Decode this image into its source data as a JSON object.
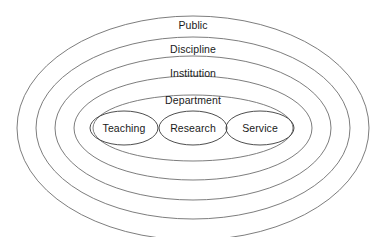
{
  "diagram": {
    "type": "nested-ellipse-venn",
    "title": "",
    "background_color": "#ffffff",
    "ring_stroke_color": "#6e6e6e",
    "core_stroke_color": "#3a3a3a",
    "text_color": "#1a1a1a",
    "center": {
      "cx": 193,
      "cy": 128
    },
    "rings": [
      {
        "label": "Public",
        "level": 1,
        "rx": 176,
        "ry": 112,
        "label_x": 193,
        "label_y": 25
      },
      {
        "label": "Discipline",
        "level": 2,
        "rx": 157,
        "ry": 91,
        "label_x": 193,
        "label_y": 49
      },
      {
        "label": "Institution",
        "level": 3,
        "rx": 138,
        "ry": 72,
        "label_x": 193,
        "label_y": 73
      },
      {
        "label": "Department",
        "level": 4,
        "rx": 119,
        "ry": 52,
        "label_x": 193,
        "label_y": 100
      },
      {
        "label": "",
        "level": 5,
        "rx": 100,
        "ry": 33,
        "label_x": 193,
        "label_y": 0
      }
    ],
    "core_ellipses": [
      {
        "label": "Teaching",
        "cx": 124,
        "cy": 128,
        "rx": 34,
        "ry": 17
      },
      {
        "label": "Research",
        "cx": 193,
        "cy": 128,
        "rx": 34,
        "ry": 17
      },
      {
        "label": "Service",
        "cx": 260,
        "cy": 128,
        "rx": 34,
        "ry": 17
      }
    ]
  }
}
